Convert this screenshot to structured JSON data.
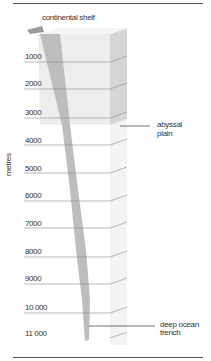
{
  "diagram": {
    "labels": {
      "top": "continental shelf",
      "abyssal_1": "abyssal",
      "abyssal_2": "plain",
      "trench_1": "deep ocean",
      "trench_2": "trench",
      "axis": "metres"
    },
    "depth_ticks": [
      "1000",
      "2000",
      "3000",
      "4000",
      "5000",
      "6000",
      "7000",
      "8000",
      "9000",
      "10 000",
      "11 000"
    ],
    "colors": {
      "block_face": "#ececec",
      "block_side": "#d6d6d6",
      "trench": "#b8b8b8",
      "rule": "#555555"
    }
  }
}
